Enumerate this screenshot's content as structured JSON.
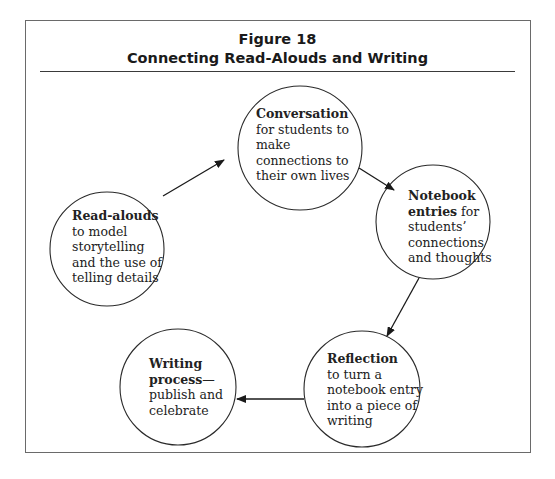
{
  "figure": {
    "number": "Figure 18",
    "title": "Connecting Read-Alouds and Writing"
  },
  "nodes": [
    {
      "id": "read-alouds",
      "bold": "Read-alouds",
      "text_lines": [
        "to model",
        "storytelling",
        "and the use of",
        "telling details"
      ]
    },
    {
      "id": "conversation",
      "bold": "Conversation",
      "text_lines": [
        "for students to",
        "make",
        "connections to",
        "their own lives"
      ]
    },
    {
      "id": "notebook",
      "bold": "Notebook",
      "bold2": "entries",
      "inline_after_bold2": " for",
      "text_lines": [
        "students’",
        "connections",
        "and thoughts"
      ]
    },
    {
      "id": "reflection",
      "bold": "Reflection",
      "text_lines": [
        "to turn a",
        "notebook entry",
        "into a piece of",
        "writing"
      ]
    },
    {
      "id": "writing-process",
      "bold": "Writing",
      "bold2": "process",
      "inline_after_bold2": "—",
      "text_lines": [
        "publish and",
        "celebrate"
      ]
    }
  ],
  "edges": [
    {
      "from": "read-alouds",
      "to": "conversation"
    },
    {
      "from": "conversation",
      "to": "notebook"
    },
    {
      "from": "notebook",
      "to": "reflection"
    },
    {
      "from": "reflection",
      "to": "writing-process"
    }
  ],
  "colors": {
    "stroke": "#2a2a2a",
    "text": "#222222",
    "frame": "#6a6a6a"
  }
}
